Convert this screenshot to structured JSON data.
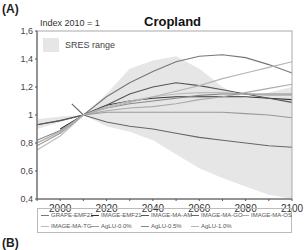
{
  "panel_labels": {
    "a": "(A)",
    "b": "(B)"
  },
  "header": {
    "index_note": "Index 2010 = 1",
    "title": "Cropland"
  },
  "sres_legend": {
    "label": "SRES range",
    "color": "#e6e6e6"
  },
  "legend": [
    {
      "label": "GRAPE-EMF21",
      "color": "#777777"
    },
    {
      "label": "IMAGE-EMF21",
      "color": "#333333"
    },
    {
      "label": "IMAGE-MA-AM",
      "color": "#555555"
    },
    {
      "label": "IMAGE-MA-GO",
      "color": "#666666"
    },
    {
      "label": "IMAGE-MA-OS",
      "color": "#aaaaaa"
    },
    {
      "label": "IMAGE-MA-TG",
      "color": "#bbbbbb"
    },
    {
      "label": "AgLU-0.0%",
      "color": "#999999"
    },
    {
      "label": "AgLU-0.5%",
      "color": "#888888"
    },
    {
      "label": "AgLU-1.0%",
      "color": "#b5b5b5"
    }
  ],
  "chart_data": {
    "type": "line",
    "title": "Cropland",
    "subtitle": "Index 2010 = 1",
    "xlabel": "",
    "ylabel": "",
    "xlim": [
      1990,
      2100
    ],
    "ylim": [
      0.4,
      1.6
    ],
    "xticks": [
      2000,
      2020,
      2040,
      2060,
      2080,
      2100
    ],
    "yticks": [
      "0,4",
      "0,6",
      "0,8",
      "1",
      "1,2",
      "1,4",
      "1,6"
    ],
    "grid": false,
    "legend_position": "bottom",
    "band": {
      "name": "SRES range",
      "x": [
        1990,
        2000,
        2010,
        2020,
        2030,
        2040,
        2050,
        2060,
        2070,
        2080,
        2090,
        2100
      ],
      "upper": [
        0.97,
        0.99,
        1.0,
        1.15,
        1.33,
        1.39,
        1.42,
        1.33,
        1.2,
        1.12,
        1.16,
        1.2
      ],
      "lower": [
        0.9,
        0.95,
        1.0,
        0.92,
        0.88,
        0.82,
        0.72,
        0.62,
        0.55,
        0.49,
        0.43,
        0.4
      ]
    },
    "series": [
      {
        "name": "GRAPE-EMF21",
        "x": [
          1990,
          2000,
          2010,
          2020,
          2030,
          2040,
          2050,
          2060,
          2070,
          2080,
          2090,
          2100
        ],
        "values": [
          0.93,
          0.96,
          1.0,
          1.13,
          1.23,
          1.31,
          1.38,
          1.42,
          1.43,
          1.41,
          1.36,
          1.3
        ]
      },
      {
        "name": "IMAGE-EMF21",
        "x": [
          2000,
          2010,
          2020,
          2030,
          2040,
          2050,
          2060,
          2070,
          2080,
          2090,
          2100
        ],
        "values": [
          0.9,
          1.0,
          1.07,
          1.1,
          1.12,
          1.13,
          1.13,
          1.13,
          1.13,
          1.12,
          1.11
        ]
      },
      {
        "name": "IMAGE-MA-AM",
        "x": [
          1990,
          2000,
          2010,
          2020,
          2030,
          2040,
          2050,
          2060,
          2070,
          2080,
          2090,
          2100
        ],
        "values": [
          0.93,
          0.96,
          1.0,
          1.07,
          1.15,
          1.2,
          1.23,
          1.21,
          1.18,
          1.15,
          1.12,
          1.09
        ]
      },
      {
        "name": "IMAGE-MA-GO",
        "x": [
          2005,
          2010,
          2020,
          2030,
          2040,
          2050,
          2060,
          2070,
          2080,
          2090,
          2100
        ],
        "values": [
          1.08,
          1.0,
          0.95,
          0.92,
          0.9,
          0.87,
          0.84,
          0.82,
          0.8,
          0.78,
          0.77
        ]
      },
      {
        "name": "IMAGE-MA-OS",
        "x": [
          1990,
          2000,
          2010,
          2020,
          2030,
          2040,
          2050,
          2060,
          2070,
          2080,
          2090,
          2100
        ],
        "values": [
          0.8,
          0.88,
          1.0,
          1.03,
          1.05,
          1.06,
          1.08,
          1.11,
          1.13,
          1.16,
          1.19,
          1.22
        ]
      },
      {
        "name": "IMAGE-MA-TG",
        "x": [
          1990,
          2000,
          2010,
          2020,
          2030,
          2040,
          2050,
          2060,
          2070,
          2080,
          2090,
          2100
        ],
        "values": [
          0.75,
          0.85,
          1.0,
          1.06,
          1.1,
          1.13,
          1.15,
          1.16,
          1.16,
          1.15,
          1.14,
          1.14
        ]
      },
      {
        "name": "AgLU-0.0%",
        "x": [
          1990,
          2000,
          2010,
          2020,
          2030,
          2040,
          2050,
          2060,
          2070,
          2080,
          2090,
          2100
        ],
        "values": [
          0.78,
          0.87,
          1.0,
          1.02,
          1.02,
          1.02,
          1.02,
          1.02,
          1.02,
          1.01,
          1.0,
          0.98
        ]
      },
      {
        "name": "AgLU-0.5%",
        "x": [
          1990,
          2000,
          2010,
          2020,
          2030,
          2040,
          2050,
          2060,
          2070,
          2080,
          2090,
          2100
        ],
        "values": [
          0.82,
          0.89,
          1.0,
          1.05,
          1.08,
          1.1,
          1.12,
          1.14,
          1.15,
          1.15,
          1.15,
          1.15
        ]
      },
      {
        "name": "AgLU-1.0%",
        "x": [
          1990,
          2000,
          2010,
          2020,
          2030,
          2040,
          2050,
          2060,
          2070,
          2080,
          2090,
          2100
        ],
        "values": [
          0.8,
          0.88,
          1.0,
          1.05,
          1.09,
          1.13,
          1.17,
          1.21,
          1.26,
          1.3,
          1.34,
          1.38
        ]
      }
    ]
  }
}
